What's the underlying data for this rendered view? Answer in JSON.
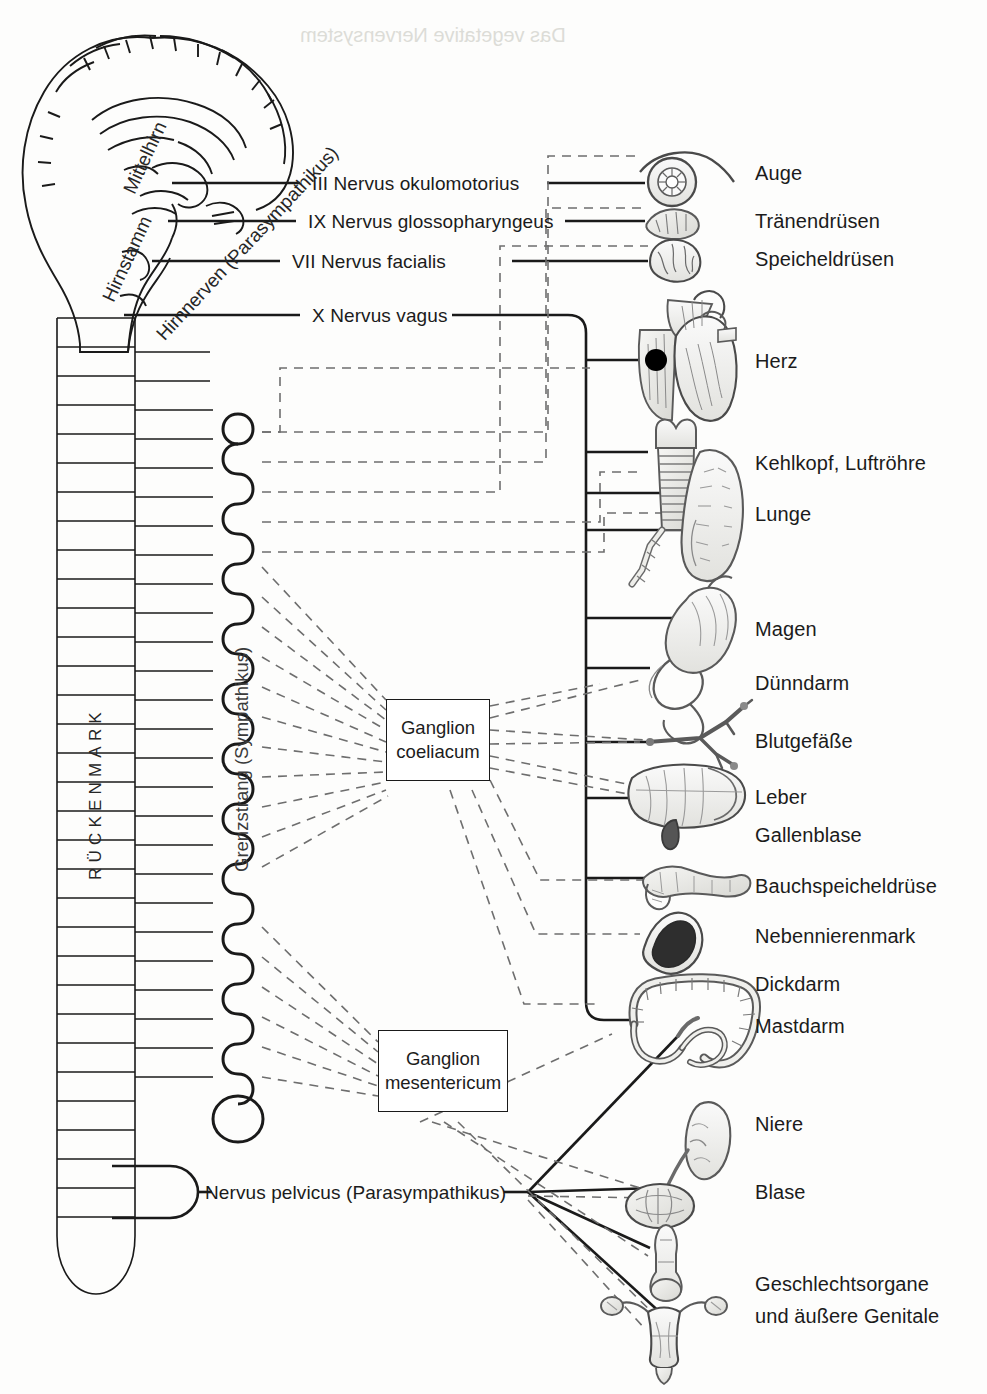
{
  "diagram": {
    "central_structures": {
      "brain_labels": [
        {
          "id": "mittelhirn",
          "text": "Mittelhirn"
        },
        {
          "id": "hirnstamm",
          "text": "Hirnstamm"
        },
        {
          "id": "hirnnerven",
          "text": "Hirnnerven (Parasympathikus)"
        }
      ],
      "spinal_cord_label": "RÜCKENMARK",
      "sympathetic_chain_label": "Grenzstrang (Sympathikus)"
    },
    "cranial_nerves": [
      {
        "numeral": "III",
        "text": "III Nervus okulomotorius"
      },
      {
        "numeral": "IX",
        "text": "IX Nervus glossopharyngeus"
      },
      {
        "numeral": "VII",
        "text": "VII Nervus facialis"
      },
      {
        "numeral": "X",
        "text": "X Nervus vagus"
      }
    ],
    "pelvic_nerve": "Nervus pelvicus (Parasympathikus)",
    "ganglia": [
      {
        "id": "coeliacum",
        "line1": "Ganglion",
        "line2": "coeliacum"
      },
      {
        "id": "mesentericum",
        "line1": "Ganglion",
        "line2": "mesentericum"
      }
    ],
    "organs": [
      {
        "id": "auge",
        "label": "Auge",
        "icon": "eye-icon"
      },
      {
        "id": "traenendruesen",
        "label": "Tränendrüsen",
        "icon": "lacrimal-gland-icon"
      },
      {
        "id": "speicheldruesen",
        "label": "Speicheldrüsen",
        "icon": "salivary-gland-icon"
      },
      {
        "id": "herz",
        "label": "Herz",
        "icon": "heart-icon"
      },
      {
        "id": "kehlkopf",
        "label": "Kehlkopf, Luftröhre",
        "icon": "trachea-icon"
      },
      {
        "id": "lunge",
        "label": "Lunge",
        "icon": "lung-icon"
      },
      {
        "id": "magen",
        "label": "Magen",
        "icon": "stomach-icon"
      },
      {
        "id": "duenndarm",
        "label": "Dünndarm",
        "icon": "small-intestine-icon"
      },
      {
        "id": "blutgefaesse",
        "label": "Blutgefäße",
        "icon": "blood-vessel-icon"
      },
      {
        "id": "leber",
        "label": "Leber",
        "icon": "liver-icon"
      },
      {
        "id": "gallenblase",
        "label": "Gallenblase",
        "icon": "gallbladder-icon"
      },
      {
        "id": "bauchspeicheldruese",
        "label": "Bauchspeicheldrüse",
        "icon": "pancreas-icon"
      },
      {
        "id": "nebennierenmark",
        "label": "Nebennierenmark",
        "icon": "adrenal-medulla-icon"
      },
      {
        "id": "dickdarm",
        "label": "Dickdarm",
        "icon": "large-intestine-icon"
      },
      {
        "id": "mastdarm",
        "label": "Mastdarm",
        "icon": "rectum-icon"
      },
      {
        "id": "niere",
        "label": "Niere",
        "icon": "kidney-icon"
      },
      {
        "id": "blase",
        "label": "Blase",
        "icon": "bladder-icon"
      },
      {
        "id": "genitale",
        "label": "Geschlechtsorgane",
        "label2": "und äußere Genitale",
        "icon": "genital-organs-icon"
      }
    ],
    "legend_semantics": {
      "solid_line": "Parasympathikus",
      "dashed_line": "Sympathikus",
      "marker_dot": "Synapse am Herzen"
    },
    "colors": {
      "ink": "#1a1a1a",
      "dashed": "#6e6e6e",
      "organ_fill": "#efefec",
      "organ_stroke": "#6b6b6b",
      "paper": "#fdfdfc"
    }
  }
}
